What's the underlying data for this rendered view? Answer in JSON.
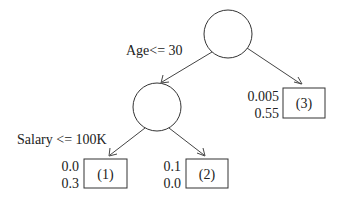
{
  "diagram": {
    "type": "decision-tree",
    "nodes": [
      {
        "id": "root",
        "kind": "split",
        "label": ""
      },
      {
        "id": "left",
        "kind": "split",
        "label": ""
      },
      {
        "id": "leaf1",
        "kind": "leaf",
        "label": "(1)",
        "values": [
          "0.0",
          "0.3"
        ]
      },
      {
        "id": "leaf2",
        "kind": "leaf",
        "label": "(2)",
        "values": [
          "0.1",
          "0.0"
        ]
      },
      {
        "id": "leaf3",
        "kind": "leaf",
        "label": "(3)",
        "values": [
          "0.005",
          "0.55"
        ]
      }
    ],
    "edges": [
      {
        "from": "root",
        "to": "left",
        "label": "Age<= 30"
      },
      {
        "from": "root",
        "to": "leaf3",
        "label": ""
      },
      {
        "from": "left",
        "to": "leaf1",
        "label": "Salary <= 100K"
      },
      {
        "from": "left",
        "to": "leaf2",
        "label": ""
      }
    ],
    "colors": {
      "stroke": "#333333",
      "text": "#222222",
      "background": "#ffffff"
    }
  }
}
